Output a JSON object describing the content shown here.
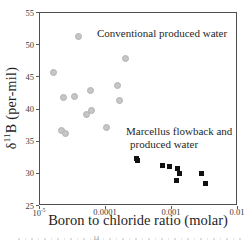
{
  "axes": {
    "y": {
      "label_delta": "δ",
      "label_sup": "11",
      "label_rest": "B (per-mil)",
      "ticks": [
        25,
        30,
        35,
        40,
        45,
        50,
        55
      ]
    },
    "x": {
      "label": "Boron to chloride ratio (molar)",
      "ticks": [
        {
          "base": "10",
          "sup": "-5",
          "value": 1e-05
        },
        {
          "base": "0.0001",
          "value": 0.0001
        },
        {
          "base": "0.001",
          "value": 0.001
        },
        {
          "base": "0.01",
          "value": 0.01
        }
      ]
    }
  },
  "caption_fragment": "11",
  "chart_data": {
    "type": "scatter",
    "x_scale": "log",
    "xlabel": "Boron to chloride ratio (molar)",
    "ylabel": "δ11B (per-mil)",
    "xlim": [
      1e-05,
      0.01
    ],
    "ylim": [
      25,
      55
    ],
    "grid": false,
    "legend": "in-plot text annotations",
    "series": [
      {
        "name": "Conventional produced water",
        "marker": "circle",
        "color": "#c6c6c6",
        "points": [
          [
            3.8e-05,
            51.3
          ],
          [
            0.0002,
            48.0
          ],
          [
            1.6e-05,
            45.8
          ],
          [
            2.3e-05,
            41.9
          ],
          [
            3.3e-05,
            42.0
          ],
          [
            5.9e-05,
            43.0
          ],
          [
            0.00015,
            43.7
          ],
          [
            0.00016,
            41.4
          ],
          [
            5e-05,
            39.2
          ],
          [
            6e-05,
            39.9
          ],
          [
            2.1e-05,
            36.7
          ],
          [
            2.4e-05,
            36.3
          ],
          [
            0.0001,
            37.2
          ]
        ]
      },
      {
        "name": "Marcellus flowback and produced water",
        "marker": "square",
        "color": "#111111",
        "points": [
          [
            0.00029,
            32.4
          ],
          [
            0.0003,
            32.0
          ],
          [
            0.00073,
            31.3
          ],
          [
            0.00093,
            31.1
          ],
          [
            0.0012,
            30.8
          ],
          [
            0.0013,
            30.0
          ],
          [
            0.00115,
            28.9
          ],
          [
            0.0028,
            30.0
          ],
          [
            0.0032,
            28.5
          ]
        ]
      }
    ],
    "annotations": [
      {
        "text": "Conventional produced water"
      },
      {
        "text": "Marcellus flowback and produced water",
        "line1": "Marcellus flowback and",
        "line2": "produced water"
      }
    ]
  }
}
